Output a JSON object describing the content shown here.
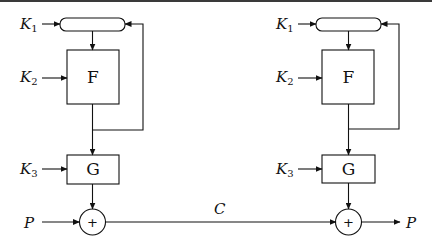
{
  "diagram": {
    "type": "block-diagram",
    "left_stage": {
      "register": {
        "input_label": "K",
        "input_sub": "1"
      },
      "f_box": {
        "label": "F",
        "input_label": "K",
        "input_sub": "2"
      },
      "g_box": {
        "label": "G",
        "input_label": "K",
        "input_sub": "3"
      },
      "xor": {
        "symbol": "+",
        "input_label": "P"
      }
    },
    "channel": {
      "label": "C"
    },
    "right_stage": {
      "register": {
        "input_label": "K",
        "input_sub": "1"
      },
      "f_box": {
        "label": "F",
        "input_label": "K",
        "input_sub": "2"
      },
      "g_box": {
        "label": "G",
        "input_label": "K",
        "input_sub": "3"
      },
      "xor": {
        "symbol": "+",
        "output_label": "P"
      }
    }
  }
}
